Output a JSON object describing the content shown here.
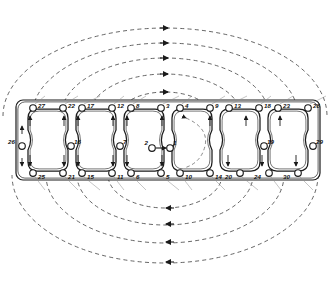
{
  "diagram": {
    "total_bolts": 30,
    "cylinder_count": 6,
    "line_color": "#1a1a1a",
    "arc_color": "#4a4a4a",
    "bolt_fill": "#ffffff"
  },
  "gasket": {
    "frame": {
      "x": 16,
      "y": 100,
      "width": 304,
      "height": 80,
      "corner_radius": 7
    },
    "bores": [
      {
        "id": "bore-1",
        "cx": 48,
        "cy": 140
      },
      {
        "id": "bore-2",
        "cx": 96,
        "cy": 140
      },
      {
        "id": "bore-3",
        "cx": 144,
        "cy": 140
      },
      {
        "id": "bore-4",
        "cx": 192,
        "cy": 140
      },
      {
        "id": "bore-5",
        "cx": 240,
        "cy": 140
      },
      {
        "id": "bore-6",
        "cx": 288,
        "cy": 140
      }
    ],
    "bore_width": 40,
    "bore_height": 62
  },
  "bolts": {
    "top_row": [
      {
        "label": "27",
        "cx": 33,
        "cy": 108,
        "lx": 38,
        "ly": 106
      },
      {
        "label": "22",
        "cx": 63,
        "cy": 108,
        "lx": 68,
        "ly": 106
      },
      {
        "label": "17",
        "cx": 82,
        "cy": 108,
        "lx": 87,
        "ly": 106
      },
      {
        "label": "12",
        "cx": 112,
        "cy": 108,
        "lx": 117,
        "ly": 106
      },
      {
        "label": "8",
        "cx": 131,
        "cy": 108,
        "lx": 136,
        "ly": 106
      },
      {
        "label": "3",
        "cx": 161,
        "cy": 108,
        "lx": 166,
        "ly": 106
      },
      {
        "label": "4",
        "cx": 180,
        "cy": 108,
        "lx": 185,
        "ly": 106
      },
      {
        "label": "9",
        "cx": 210,
        "cy": 108,
        "lx": 215,
        "ly": 106
      },
      {
        "label": "13",
        "cx": 229,
        "cy": 108,
        "lx": 234,
        "ly": 106
      },
      {
        "label": "18",
        "cx": 259,
        "cy": 108,
        "lx": 264,
        "ly": 106
      },
      {
        "label": "23",
        "cx": 278,
        "cy": 108,
        "lx": 283,
        "ly": 106
      },
      {
        "label": "28",
        "cx": 308,
        "cy": 108,
        "lx": 313,
        "ly": 106
      }
    ],
    "bottom_row": [
      {
        "label": "25",
        "cx": 33,
        "cy": 173,
        "lx": 38,
        "ly": 177
      },
      {
        "label": "21",
        "cx": 63,
        "cy": 173,
        "lx": 68,
        "ly": 177
      },
      {
        "label": "15",
        "cx": 82,
        "cy": 173,
        "lx": 87,
        "ly": 177
      },
      {
        "label": "11",
        "cx": 112,
        "cy": 173,
        "lx": 117,
        "ly": 177
      },
      {
        "label": "6",
        "cx": 131,
        "cy": 173,
        "lx": 136,
        "ly": 177
      },
      {
        "label": "5",
        "cx": 161,
        "cy": 173,
        "lx": 166,
        "ly": 177
      },
      {
        "label": "10",
        "cx": 180,
        "cy": 173,
        "lx": 185,
        "ly": 177
      },
      {
        "label": "14",
        "cx": 210,
        "cy": 173,
        "lx": 215,
        "ly": 177
      },
      {
        "label": "20",
        "cx": 240,
        "cy": 173,
        "lx": 232,
        "ly": 177
      },
      {
        "label": "24",
        "cx": 269,
        "cy": 173,
        "lx": 261,
        "ly": 177
      },
      {
        "label": "30",
        "cx": 298,
        "cy": 173,
        "lx": 290,
        "ly": 177
      }
    ],
    "mid_row": [
      {
        "label": "26",
        "cx": 22,
        "cy": 146,
        "lx": 15,
        "ly": 142
      },
      {
        "label": "16",
        "cx": 71,
        "cy": 146,
        "lx": 74,
        "ly": 142
      },
      {
        "label": "7",
        "cx": 120,
        "cy": 146,
        "lx": 123,
        "ly": 142
      },
      {
        "label": "2",
        "cx": 152,
        "cy": 148,
        "lx": 148,
        "ly": 143
      },
      {
        "label": "1",
        "cx": 170,
        "cy": 148,
        "lx": 173,
        "ly": 143
      },
      {
        "label": "19",
        "cx": 264,
        "cy": 146,
        "lx": 267,
        "ly": 142
      },
      {
        "label": "29",
        "cx": 313,
        "cy": 146,
        "lx": 316,
        "ly": 142
      }
    ]
  },
  "arcs": {
    "top": [
      {
        "rx": 46,
        "ry": 24,
        "arrow_x": 165,
        "arrow_y": 92
      },
      {
        "rx": 76,
        "ry": 42,
        "arrow_x": 165,
        "arrow_y": 74
      },
      {
        "rx": 104,
        "ry": 58,
        "arrow_x": 165,
        "arrow_y": 58
      },
      {
        "rx": 133,
        "ry": 73,
        "arrow_x": 165,
        "arrow_y": 43
      },
      {
        "rx": 162,
        "ry": 88,
        "arrow_x": 165,
        "arrow_y": 28
      }
    ],
    "bottom": [
      {
        "rx": 57,
        "ry": 33,
        "arrow_x": 169,
        "arrow_y": 208
      },
      {
        "rx": 88,
        "ry": 50,
        "arrow_x": 169,
        "arrow_y": 224
      },
      {
        "rx": 119,
        "ry": 68,
        "arrow_x": 169,
        "arrow_y": 242
      },
      {
        "rx": 153,
        "ry": 88,
        "arrow_x": 169,
        "arrow_y": 262
      }
    ],
    "center_x": 165,
    "top_baseline": 116,
    "bottom_baseline": 175
  },
  "center_arrow": {
    "from_label": "2",
    "to_label": "1",
    "x1": 156,
    "y1": 148,
    "x2": 166,
    "y2": 148
  }
}
